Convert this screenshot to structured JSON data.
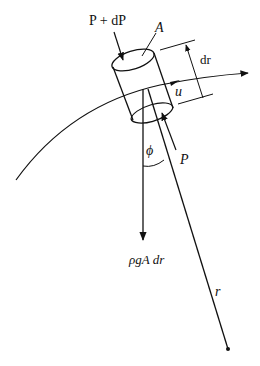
{
  "figure": {
    "type": "fluid-element-force-diagram",
    "labels": {
      "pressure_top": "P + dP",
      "area": "A",
      "element_length": "dr",
      "velocity": "u",
      "angle": "ϕ",
      "pressure_bottom": "P",
      "weight": "ρgA dr",
      "radius": "r"
    },
    "colors": {
      "stroke": "#111111",
      "background": "#ffffff"
    }
  }
}
